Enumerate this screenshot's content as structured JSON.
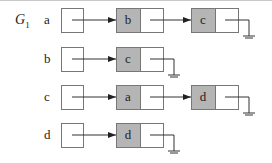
{
  "title": "G",
  "title_subscript": "1",
  "colors": {
    "node_fill": "#b5b5b5",
    "stroke": "#333333",
    "box_stroke": "#777777"
  },
  "rows": [
    {
      "vertex": "a",
      "adjacent": [
        "b",
        "c"
      ]
    },
    {
      "vertex": "b",
      "adjacent": [
        "c"
      ]
    },
    {
      "vertex": "c",
      "adjacent": [
        "a",
        "d"
      ]
    },
    {
      "vertex": "d",
      "adjacent": [
        "d"
      ]
    }
  ]
}
